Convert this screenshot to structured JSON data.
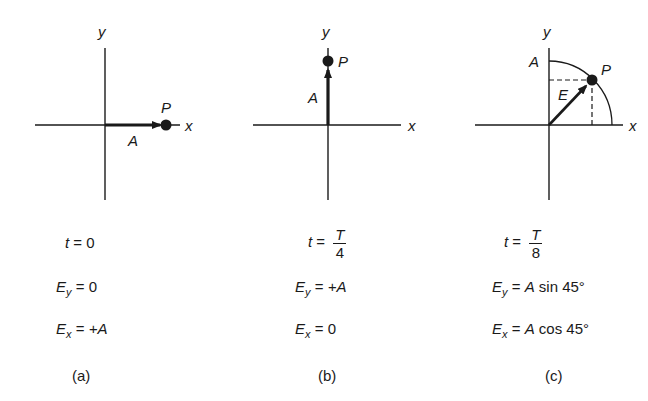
{
  "panels": [
    {
      "id": "a",
      "axis_x_label": "x",
      "axis_y_label": "y",
      "point_label": "P",
      "vector_label": "A",
      "time_var": "t",
      "time_value": "0",
      "ey_var": "E",
      "ey_sub": "y",
      "ey_value": "0",
      "ex_var": "E",
      "ex_sub": "x",
      "ex_value": "+A",
      "caption": "(a)"
    },
    {
      "id": "b",
      "axis_x_label": "x",
      "axis_y_label": "y",
      "point_label": "P",
      "vector_label": "A",
      "time_var": "t",
      "time_num": "T",
      "time_den": "4",
      "ey_var": "E",
      "ey_sub": "y",
      "ey_value": "+A",
      "ex_var": "E",
      "ex_sub": "x",
      "ex_value": "0",
      "caption": "(b)"
    },
    {
      "id": "c",
      "axis_x_label": "x",
      "axis_y_label": "y",
      "point_label": "P",
      "vector_label": "E",
      "amplitude_label": "A",
      "time_var": "t",
      "time_num": "T",
      "time_den": "8",
      "ey_var": "E",
      "ey_sub": "y",
      "ey_value_A": "A",
      "ey_value_rest": "sin 45°",
      "ex_var": "E",
      "ex_sub": "x",
      "ex_value_A": "A",
      "ex_value_rest": "cos 45°",
      "caption": "(c)"
    }
  ],
  "colors": {
    "ink": "#1a1a1a",
    "background": "#ffffff"
  }
}
